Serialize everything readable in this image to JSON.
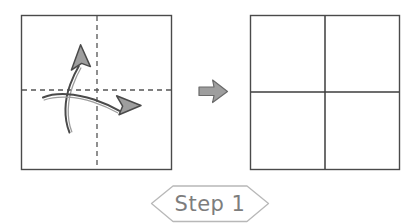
{
  "diagram": {
    "kind": "origami-fold-instruction",
    "background_color": "#ffffff",
    "panels": [
      {
        "name": "before-panel",
        "description": "Square sheet with dashed vertical and horizontal fold lines",
        "x": 21,
        "y": 15,
        "width": 151,
        "height": 155,
        "outline_color": "#4a4a4a",
        "fold_lines": [
          {
            "name": "vertical-fold-line",
            "style": "dashed",
            "color": "#555555"
          },
          {
            "name": "horizontal-fold-line",
            "style": "dashed",
            "color": "#555555"
          }
        ],
        "arrows": [
          {
            "name": "fold-up-arrow",
            "direction": "up",
            "fill": "#9e9e9e",
            "stroke": "#4a4a4a"
          },
          {
            "name": "fold-right-arrow",
            "direction": "right",
            "fill": "#9e9e9e",
            "stroke": "#4a4a4a"
          }
        ]
      },
      {
        "name": "after-panel",
        "description": "Square sheet showing completed creases as solid lines",
        "x": 250,
        "y": 15,
        "width": 150,
        "height": 155,
        "outline_color": "#4a4a4a",
        "fold_lines": [
          {
            "name": "vertical-crease-line",
            "style": "solid",
            "color": "#3d3d3d"
          },
          {
            "name": "horizontal-crease-line",
            "style": "solid",
            "color": "#3d3d3d"
          }
        ]
      }
    ],
    "transition_arrow": {
      "name": "transition-arrow",
      "direction": "right",
      "fill": "#9e9e9e",
      "stroke": "#6a6a6a",
      "x": 196,
      "y": 83
    },
    "step_banner": {
      "label": "Step 1",
      "shape": "hexagon-banner",
      "outline_color": "#b8b8b8",
      "text_color": "#7d7d7d",
      "x": 151,
      "y": 185,
      "width": 118,
      "height": 37
    }
  }
}
